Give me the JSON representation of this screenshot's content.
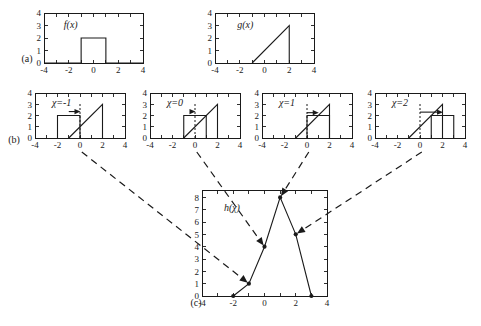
{
  "figure": {
    "background": "#ffffff",
    "ink": "#1a1a1a",
    "row_labels": [
      {
        "name": "row-label-a",
        "text": "(a)"
      },
      {
        "name": "row-label-b",
        "text": "(b)"
      },
      {
        "name": "row-label-c",
        "text": "(c)"
      }
    ]
  },
  "chart_data": [
    {
      "id": "plot-fx",
      "type": "line",
      "title": "f(x)",
      "xlabel": "",
      "ylabel": "",
      "xlim": [
        -4,
        4
      ],
      "ylim": [
        0,
        4
      ],
      "xticks": [
        -4,
        -3,
        -2,
        -1,
        0,
        1,
        2,
        3,
        4
      ],
      "xticklabels": [
        "-4",
        "",
        "-2",
        "",
        "0",
        "",
        "2",
        "",
        "4"
      ],
      "yticks": [
        0,
        1,
        2,
        3,
        4
      ],
      "yticklabels": [
        "0",
        "1",
        "2",
        "3",
        "4"
      ],
      "grid": false,
      "legend": "none",
      "series": [
        {
          "name": "f",
          "x": [
            -4,
            -1,
            -1,
            1,
            1,
            4
          ],
          "y": [
            0,
            0,
            2,
            2,
            0,
            0
          ]
        }
      ],
      "annotations": [
        {
          "text": "f(x)",
          "x": -2.4,
          "y": 3.05
        }
      ]
    },
    {
      "id": "plot-gx",
      "type": "line",
      "title": "g(x)",
      "xlabel": "",
      "ylabel": "",
      "xlim": [
        -4,
        4
      ],
      "ylim": [
        0,
        4
      ],
      "xticks": [
        -4,
        -3,
        -2,
        -1,
        0,
        1,
        2,
        3,
        4
      ],
      "xticklabels": [
        "-4",
        "",
        "-2",
        "",
        "0",
        "",
        "2",
        "",
        "4"
      ],
      "yticks": [
        0,
        1,
        2,
        3,
        4
      ],
      "yticklabels": [
        "0",
        "1",
        "2",
        "3",
        "4"
      ],
      "grid": false,
      "legend": "none",
      "series": [
        {
          "name": "g",
          "x": [
            -1,
            2,
            2
          ],
          "y": [
            0,
            3,
            0
          ]
        }
      ],
      "annotations": [
        {
          "text": "g(x)",
          "x": -2.2,
          "y": 3.05
        }
      ]
    },
    {
      "id": "plot-chi-neg1",
      "type": "line",
      "title": "χ=-1",
      "xlabel": "",
      "ylabel": "",
      "xlim": [
        -4,
        4
      ],
      "ylim": [
        0,
        4
      ],
      "xticks": [
        -4,
        -3,
        -2,
        -1,
        0,
        1,
        2,
        3,
        4
      ],
      "xticklabels": [
        "-4",
        "",
        "-2",
        "",
        "0",
        "",
        "2",
        "",
        "4"
      ],
      "yticks": [
        0,
        1,
        2,
        3,
        4
      ],
      "yticklabels": [
        "0",
        "1",
        "2",
        "3",
        "4"
      ],
      "grid": false,
      "legend": "none",
      "series": [
        {
          "name": "f-shifted",
          "x": [
            -2,
            -2,
            0,
            0
          ],
          "y": [
            0,
            2,
            2,
            0
          ]
        },
        {
          "name": "g",
          "x": [
            -1,
            2,
            2
          ],
          "y": [
            0,
            3,
            0
          ]
        }
      ],
      "marker_line_x": 0,
      "shift_arrow": {
        "from_x": -1.0,
        "to_x": 0.0,
        "y": 2.35
      },
      "annotations": [
        {
          "text": "χ=-1",
          "x": -2.5,
          "y": 3.15
        }
      ]
    },
    {
      "id": "plot-chi-0",
      "type": "line",
      "title": "χ=0",
      "xlabel": "",
      "ylabel": "",
      "xlim": [
        -4,
        4
      ],
      "ylim": [
        0,
        4
      ],
      "xticks": [
        -4,
        -3,
        -2,
        -1,
        0,
        1,
        2,
        3,
        4
      ],
      "xticklabels": [
        "-4",
        "",
        "-2",
        "",
        "0",
        "",
        "2",
        "",
        "4"
      ],
      "yticks": [
        0,
        1,
        2,
        3,
        4
      ],
      "yticklabels": [
        "0",
        "1",
        "2",
        "3",
        "4"
      ],
      "grid": false,
      "legend": "none",
      "series": [
        {
          "name": "f-shifted",
          "x": [
            -1,
            -1,
            1,
            1
          ],
          "y": [
            0,
            2,
            2,
            0
          ]
        },
        {
          "name": "g",
          "x": [
            -1,
            2,
            2
          ],
          "y": [
            0,
            3,
            0
          ]
        }
      ],
      "marker_line_x": 0,
      "shift_arrow": {
        "from_x": 0.0,
        "to_x": 0.0,
        "y": 2.35
      },
      "annotations": [
        {
          "text": "χ=0",
          "x": -2.5,
          "y": 3.15
        }
      ]
    },
    {
      "id": "plot-chi-1",
      "type": "line",
      "title": "χ=1",
      "xlabel": "",
      "ylabel": "",
      "xlim": [
        -4,
        4
      ],
      "ylim": [
        0,
        4
      ],
      "xticks": [
        -4,
        -3,
        -2,
        -1,
        0,
        1,
        2,
        3,
        4
      ],
      "xticklabels": [
        "-4",
        "",
        "-2",
        "",
        "0",
        "",
        "2",
        "",
        "4"
      ],
      "yticks": [
        0,
        1,
        2,
        3,
        4
      ],
      "yticklabels": [
        "0",
        "1",
        "2",
        "3",
        "4"
      ],
      "grid": false,
      "legend": "none",
      "series": [
        {
          "name": "f-shifted",
          "x": [
            0,
            0,
            2,
            2
          ],
          "y": [
            0,
            2,
            2,
            0
          ]
        },
        {
          "name": "g",
          "x": [
            -1,
            2,
            2
          ],
          "y": [
            0,
            3,
            0
          ]
        }
      ],
      "marker_line_x": 0,
      "shift_arrow": {
        "from_x": 0.0,
        "to_x": 1.0,
        "y": 2.25
      },
      "annotations": [
        {
          "text": "χ=1",
          "x": -2.5,
          "y": 3.15
        }
      ]
    },
    {
      "id": "plot-chi-2",
      "type": "line",
      "title": "χ=2",
      "xlabel": "",
      "ylabel": "",
      "xlim": [
        -4,
        4
      ],
      "ylim": [
        0,
        4
      ],
      "xticks": [
        -4,
        -3,
        -2,
        -1,
        0,
        1,
        2,
        3,
        4
      ],
      "xticklabels": [
        "-4",
        "",
        "-2",
        "",
        "0",
        "",
        "2",
        "",
        "4"
      ],
      "yticks": [
        0,
        1,
        2,
        3,
        4
      ],
      "yticklabels": [
        "0",
        "1",
        "2",
        "3",
        "4"
      ],
      "grid": false,
      "legend": "none",
      "series": [
        {
          "name": "f-shifted",
          "x": [
            1,
            1,
            3,
            3
          ],
          "y": [
            0,
            2,
            2,
            0
          ]
        },
        {
          "name": "g",
          "x": [
            -1,
            2,
            2
          ],
          "y": [
            0,
            3,
            0
          ]
        }
      ],
      "marker_line_x": 0,
      "shift_arrow": {
        "from_x": 0.0,
        "to_x": 2.0,
        "y": 2.3
      },
      "annotations": [
        {
          "text": "χ=2",
          "x": -2.5,
          "y": 3.15
        }
      ]
    },
    {
      "id": "plot-h-chi",
      "type": "line",
      "title": "h(χ)",
      "xlabel": "",
      "ylabel": "",
      "xlim": [
        -4,
        4
      ],
      "ylim": [
        0,
        8.6
      ],
      "xticks": [
        -4,
        -3,
        -2,
        -1,
        0,
        1,
        2,
        3,
        4
      ],
      "xticklabels": [
        "-4",
        "",
        "-2",
        "",
        "0",
        "",
        "2",
        "",
        "4"
      ],
      "yticks": [
        0,
        1,
        2,
        3,
        4,
        5,
        6,
        7,
        8
      ],
      "yticklabels": [
        "0",
        "1",
        "2",
        "3",
        "4",
        "5",
        "6",
        "7",
        "8"
      ],
      "grid": false,
      "legend": "none",
      "series": [
        {
          "name": "h",
          "x": [
            -2,
            -1,
            0,
            1,
            2,
            3
          ],
          "y": [
            0,
            1,
            4,
            8,
            5,
            0
          ],
          "markers": true
        }
      ],
      "annotations": [
        {
          "text": "h(χ)",
          "x": -2.6,
          "y": 7.1
        }
      ]
    }
  ],
  "connectors": [
    {
      "name": "connector-chi-neg1",
      "from_panel": "plot-chi-neg1",
      "to_point": {
        "x": -1,
        "y": 1
      }
    },
    {
      "name": "connector-chi-0",
      "from_panel": "plot-chi-0",
      "to_point": {
        "x": 0,
        "y": 4
      }
    },
    {
      "name": "connector-chi-1",
      "from_panel": "plot-chi-1",
      "to_point": {
        "x": 1,
        "y": 8
      }
    },
    {
      "name": "connector-chi-2",
      "from_panel": "plot-chi-2",
      "to_point": {
        "x": 2,
        "y": 5
      }
    }
  ]
}
